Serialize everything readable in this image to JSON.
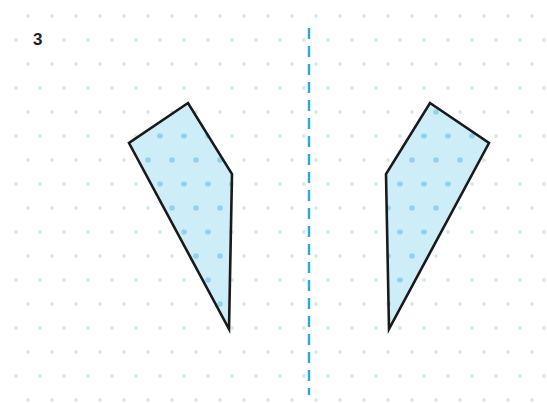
{
  "canvas": {
    "width": 547,
    "height": 403,
    "background": "#ffffff"
  },
  "label": {
    "problem_number": "3"
  },
  "palette": {
    "grid_dot": "#cdeee6",
    "grid_dot_inside_shape": "#8fd4ec",
    "mirror_line": "#2aa8e2",
    "shape_fill": "#cdeef8",
    "shape_stroke": "#1a1a1a",
    "label_text": "#221f1f"
  },
  "grid": {
    "type": "staggered-dot-lattice",
    "spacing_x": 24,
    "spacing_y": 24,
    "row_offset_x": 12,
    "dot_radius": 1.9,
    "origin_x": 64,
    "origin_y": 40,
    "columns": 21,
    "rows": 16
  },
  "mirror_line": {
    "name": "line-of-symmetry",
    "orientation": "vertical",
    "x": 309,
    "y_start": 28,
    "y_end": 395,
    "stroke_width": 2.4,
    "dash": 11,
    "gap": 7,
    "color": "#2aa8e2"
  },
  "shapes": [
    {
      "name": "left-quadrilateral",
      "side": "left",
      "vertex_count": 4,
      "points": "188,103 129,143 229,329 232,174",
      "fill": "#cdeef8",
      "stroke": "#1a1a1a",
      "stroke_width": 2.6
    },
    {
      "name": "right-quadrilateral",
      "side": "right",
      "vertex_count": 4,
      "points": "430,103 489,143 389,329 386,174",
      "fill": "#cdeef8",
      "stroke": "#1a1a1a",
      "stroke_width": 2.6
    }
  ],
  "chart_data": {
    "type": "diagram",
    "subtype": "reflection-symmetry",
    "title": "3",
    "axis_of_symmetry": {
      "orientation": "vertical",
      "x": 309
    },
    "figures": [
      {
        "label": "left-quadrilateral",
        "vertices": [
          [
            188,
            103
          ],
          [
            129,
            143
          ],
          [
            229,
            329
          ],
          [
            232,
            174
          ]
        ]
      },
      {
        "label": "right-quadrilateral",
        "vertices": [
          [
            430,
            103
          ],
          [
            489,
            143
          ],
          [
            389,
            329
          ],
          [
            386,
            174
          ]
        ]
      }
    ]
  }
}
